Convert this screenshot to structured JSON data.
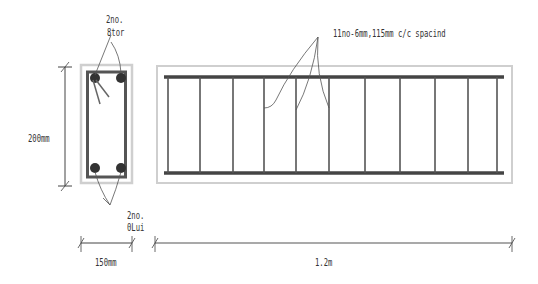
{
  "diagram": {
    "type": "beam-reinforcement-detail",
    "colors": {
      "concrete_outline": "#c8c8c8",
      "steel": "#555555",
      "bar": "#333333",
      "dimension": "#444444",
      "text": "#333333"
    },
    "cross_section": {
      "top_bars": {
        "count_label": "2no.",
        "size_label": "8tor"
      },
      "bottom_bars": {
        "count_label": "2no.",
        "size_label": "0Lui"
      },
      "height_dim": "200mm",
      "width_dim": "150mm"
    },
    "longitudinal": {
      "stirrup_note": "11no-6mm,115mm c/c spacind",
      "stirrup_count": 11,
      "length_dim": "1.2m"
    }
  }
}
